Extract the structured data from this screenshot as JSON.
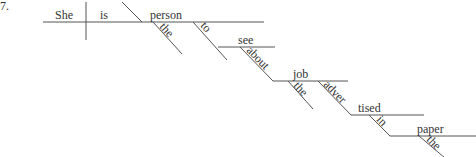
{
  "item_number": "7.",
  "words": {
    "subject": "She",
    "verb": "is",
    "predicate_noun": "person",
    "article_person": "the",
    "infinitive_to": "to",
    "infinitive_verb": "see",
    "preposition_about": "about",
    "object_job": "job",
    "article_job": "the",
    "participle_part1": "adver",
    "participle_part2": "tised",
    "preposition_in": "in",
    "object_paper": "paper",
    "article_paper": "the"
  }
}
